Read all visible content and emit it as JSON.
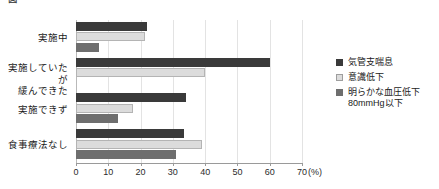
{
  "header": {
    "cutoff_title": "図　　　　　　　　　　　　　　　　　　　　　　　　　　"
  },
  "chart_data": {
    "type": "bar",
    "orientation": "horizontal",
    "title": "",
    "xlabel": "",
    "ylabel": "",
    "xunit": "(%)",
    "xlim": [
      0,
      70
    ],
    "xticks": [
      0,
      10,
      20,
      30,
      40,
      50,
      60,
      70
    ],
    "grid": true,
    "legend_position": "right",
    "categories": [
      "実施中",
      "実施していたが\n緩んできた",
      "実施できず",
      "食事療法なし"
    ],
    "series": [
      {
        "name": "気管支喘息",
        "color": "#3a3a3a",
        "values": [
          22,
          60,
          34,
          33.5
        ]
      },
      {
        "name": "意識低下",
        "color": "#dcdcdc",
        "values": [
          21.5,
          40,
          17.5,
          39
        ]
      },
      {
        "name": "明らかな血圧低下\n80mmHg以下",
        "color": "#6e6e6e",
        "values": [
          7,
          0,
          13,
          31
        ]
      }
    ]
  }
}
